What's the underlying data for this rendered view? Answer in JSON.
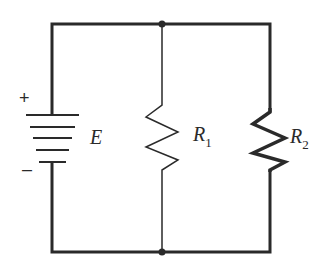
{
  "diagram": {
    "type": "parallel circuit",
    "source": {
      "label": "E",
      "plus": "+",
      "minus": "–"
    },
    "resistors": [
      {
        "label": "R",
        "subscript": "1"
      },
      {
        "label": "R",
        "subscript": "2"
      }
    ],
    "colors": {
      "wire": "#2a2a2a",
      "background": "#ffffff"
    }
  }
}
